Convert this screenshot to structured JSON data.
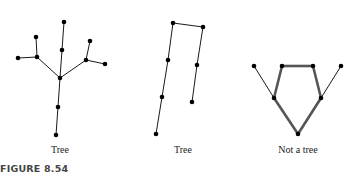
{
  "figure": {
    "label": "FIGURE 8.54",
    "graphs": [
      {
        "caption": "Tree",
        "caption_x": 60,
        "nodes": [
          {
            "id": "top",
            "x": 64,
            "y": 22
          },
          {
            "id": "upper",
            "x": 62,
            "y": 50
          },
          {
            "id": "center",
            "x": 60,
            "y": 78
          },
          {
            "id": "left_joint",
            "x": 37,
            "y": 57
          },
          {
            "id": "left_top",
            "x": 36,
            "y": 37
          },
          {
            "id": "far_left",
            "x": 18,
            "y": 58
          },
          {
            "id": "right_joint",
            "x": 86,
            "y": 60
          },
          {
            "id": "right_top",
            "x": 90,
            "y": 41
          },
          {
            "id": "far_right",
            "x": 105,
            "y": 64
          },
          {
            "id": "lower",
            "x": 58,
            "y": 107
          },
          {
            "id": "bottom",
            "x": 56,
            "y": 135
          }
        ],
        "edges": [
          [
            "top",
            "upper"
          ],
          [
            "upper",
            "center"
          ],
          [
            "center",
            "left_joint"
          ],
          [
            "left_joint",
            "left_top"
          ],
          [
            "left_joint",
            "far_left"
          ],
          [
            "center",
            "right_joint"
          ],
          [
            "right_joint",
            "right_top"
          ],
          [
            "right_joint",
            "far_right"
          ],
          [
            "center",
            "lower"
          ],
          [
            "lower",
            "bottom"
          ]
        ],
        "cycle_edges": []
      },
      {
        "caption": "Tree",
        "caption_x": 183,
        "nodes": [
          {
            "id": "top_left",
            "x": 173,
            "y": 23
          },
          {
            "id": "top_right",
            "x": 203,
            "y": 27
          },
          {
            "id": "left_mid",
            "x": 168,
            "y": 60
          },
          {
            "id": "left_low",
            "x": 162,
            "y": 97
          },
          {
            "id": "left_bottom",
            "x": 156,
            "y": 134
          },
          {
            "id": "right_mid",
            "x": 197,
            "y": 65
          },
          {
            "id": "right_bottom",
            "x": 192,
            "y": 102
          }
        ],
        "edges": [
          [
            "top_left",
            "top_right"
          ],
          [
            "top_left",
            "left_mid"
          ],
          [
            "left_mid",
            "left_low"
          ],
          [
            "left_low",
            "left_bottom"
          ],
          [
            "top_right",
            "right_mid"
          ],
          [
            "right_mid",
            "right_bottom"
          ]
        ],
        "cycle_edges": []
      },
      {
        "caption": "Not a tree",
        "caption_x": 298,
        "nodes": [
          {
            "id": "far_left",
            "x": 254,
            "y": 66
          },
          {
            "id": "top_left",
            "x": 282,
            "y": 66
          },
          {
            "id": "top_right",
            "x": 313,
            "y": 66
          },
          {
            "id": "far_right",
            "x": 341,
            "y": 66
          },
          {
            "id": "mid_left",
            "x": 274,
            "y": 98
          },
          {
            "id": "mid_right",
            "x": 321,
            "y": 98
          },
          {
            "id": "bottom",
            "x": 298,
            "y": 134
          }
        ],
        "edges": [
          [
            "far_left",
            "mid_left"
          ],
          [
            "far_right",
            "mid_right"
          ]
        ],
        "cycle_edges": [
          [
            "top_left",
            "top_right"
          ],
          [
            "top_right",
            "mid_right"
          ],
          [
            "mid_right",
            "bottom"
          ],
          [
            "bottom",
            "mid_left"
          ],
          [
            "mid_left",
            "top_left"
          ]
        ]
      }
    ]
  }
}
